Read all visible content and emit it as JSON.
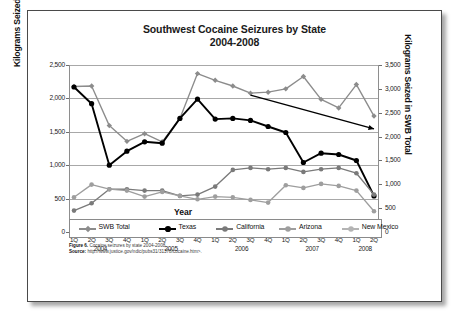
{
  "figure": {
    "title_line1": "Southwest Cocaine Seizures by State",
    "title_line2": "2004-2008",
    "caption_label": "Figure 6.",
    "caption_text": "Cocaine seizures by state 2004-2008.",
    "source_label": "Source:",
    "source_text": "http://www.justice.gov/ndic/pubs31/31378/cocaine.htm>."
  },
  "chart_data": {
    "type": "line",
    "title": "Southwest Cocaine Seizures by State 2004-2008",
    "xlabel": "Year",
    "ylabel": "Kilograms Seized Per State",
    "ylabel_right": "Kilograms Seized in SWB Total",
    "ylim": [
      0,
      2500
    ],
    "ylim_right": [
      0,
      3500
    ],
    "yticks": [
      "0",
      "500",
      "1,000",
      "1,500",
      "2,000",
      "2,500"
    ],
    "ytick_values": [
      0,
      500,
      1000,
      1500,
      2000,
      2500
    ],
    "yticks_right": [
      "0",
      "500",
      "1,000",
      "1,500",
      "2,000",
      "2,500",
      "3,000",
      "3,500"
    ],
    "ytick_values_right": [
      0,
      500,
      1000,
      1500,
      2000,
      2500,
      3000,
      3500
    ],
    "grid": true,
    "legend_position": "bottom",
    "x": [
      "1Q",
      "2Q",
      "3Q",
      "4Q",
      "1Q",
      "2Q",
      "3Q",
      "4Q",
      "1Q",
      "2Q",
      "3Q",
      "4Q",
      "1Q",
      "2Q",
      "3Q",
      "4Q",
      "1Q",
      "2Q"
    ],
    "years": [
      "2004",
      "2005",
      "2006",
      "2007",
      "2008"
    ],
    "year_spans": [
      4,
      4,
      4,
      4,
      2
    ],
    "series": [
      {
        "name": "SWB Total",
        "axis": "right",
        "color": "#8c8c8c",
        "marker": "diamond",
        "values": [
          3050,
          3060,
          2230,
          1900,
          2060,
          1890,
          2380,
          3320,
          3180,
          3060,
          2910,
          2930,
          3000,
          3260,
          2780,
          2600,
          3090,
          2430
        ]
      },
      {
        "name": "Texas",
        "axis": "left",
        "color": "#000000",
        "marker": "circle",
        "values": [
          2170,
          1920,
          1000,
          1210,
          1350,
          1330,
          1700,
          1990,
          1690,
          1700,
          1670,
          1580,
          1490,
          1040,
          1180,
          1160,
          1070,
          540
        ]
      },
      {
        "name": "California",
        "axis": "left",
        "color": "#7a7a7a",
        "marker": "circle",
        "values": [
          320,
          430,
          640,
          640,
          620,
          620,
          540,
          560,
          680,
          930,
          960,
          940,
          960,
          900,
          940,
          960,
          880,
          560
        ]
      },
      {
        "name": "Arizona",
        "axis": "left",
        "color": "#9e9e9e",
        "marker": "circle",
        "values": [
          520,
          710,
          640,
          620,
          530,
          600,
          540,
          490,
          530,
          520,
          480,
          440,
          700,
          660,
          720,
          690,
          620,
          310
        ]
      },
      {
        "name": "New Mexico",
        "axis": "left",
        "color": "#b4b4b4",
        "marker": "circle",
        "values": [
          100,
          20,
          25,
          25,
          25,
          25,
          25,
          25,
          25,
          25,
          25,
          25,
          25,
          25,
          25,
          25,
          25,
          25
        ]
      }
    ],
    "trend_annotation": {
      "label": "declining trend arrow",
      "color": "#000000",
      "from_x_index": 10,
      "from_value_right": 2870,
      "to_x_index": 17,
      "to_value_right": 2160
    }
  },
  "legend": {
    "items": [
      {
        "label": "SWB Total",
        "color": "#8c8c8c",
        "marker": "diamond"
      },
      {
        "label": "Texas",
        "color": "#000000",
        "marker": "circle"
      },
      {
        "label": "California",
        "color": "#7a7a7a",
        "marker": "circle"
      },
      {
        "label": "Arizona",
        "color": "#9e9e9e",
        "marker": "circle"
      },
      {
        "label": "New Mexico",
        "color": "#b4b4b4",
        "marker": "circle"
      }
    ]
  }
}
